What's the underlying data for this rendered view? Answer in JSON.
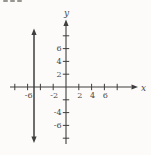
{
  "figure": {
    "kind": "textbook coordinate-plane graph",
    "background": "#fcfbf9",
    "ink": "#3e3e3e",
    "label_ink": "#4a4a4a",
    "artifact_color": "#979590",
    "artifact_note": "bottom edge of cropped-off printed text at top-left corner"
  },
  "chart_data": {
    "type": "line",
    "title": "",
    "xlabel": "x",
    "ylabel": "y",
    "xlim": [
      -8.8,
      9.5
    ],
    "ylim": [
      -9.5,
      9.5
    ],
    "grid": false,
    "legend": "none",
    "x_ticks": [
      -8,
      -6,
      -4,
      -2,
      2,
      4,
      6,
      8
    ],
    "x_tick_labels": [
      {
        "value": -6,
        "text": "-6"
      },
      {
        "value": -2,
        "text": "-2"
      },
      {
        "value": 2,
        "text": "2"
      },
      {
        "value": 4,
        "text": "4"
      },
      {
        "value": 6,
        "text": "6"
      }
    ],
    "y_ticks": [
      -8,
      -6,
      -4,
      -2,
      2,
      4,
      6,
      8
    ],
    "y_tick_labels": [
      {
        "value": 6,
        "text": "6"
      },
      {
        "value": 4,
        "text": "4"
      },
      {
        "value": 2,
        "text": "2"
      },
      {
        "value": -4,
        "text": "-4"
      },
      {
        "value": -6,
        "text": "-6"
      }
    ],
    "series": [
      {
        "name": "vertical-line",
        "description": "vertical line at x = -5 with arrowheads on both ends",
        "x": -5,
        "y_from": -8.5,
        "y_to": 8.9,
        "arrows": "both"
      }
    ],
    "axis_arrows": {
      "x": "right",
      "y": "up"
    }
  }
}
